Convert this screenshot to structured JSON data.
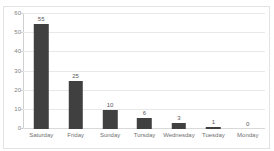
{
  "chart_data": {
    "type": "bar",
    "title": "",
    "xlabel": "",
    "ylabel": "",
    "categories": [
      "Saturday",
      "Friday",
      "Sunday",
      "Tursday",
      "Wednesday",
      "Tuesday",
      "Monday"
    ],
    "values": [
      55,
      25,
      10,
      6,
      3,
      1,
      0
    ],
    "value_labels": [
      "55",
      "25",
      "10",
      "6",
      "3",
      "1",
      "0"
    ],
    "ylim": [
      0,
      60
    ],
    "yticks": [
      0,
      10,
      20,
      30,
      40,
      50,
      60
    ],
    "ytick_labels": [
      "0",
      "10",
      "20",
      "30",
      "40",
      "50",
      "60"
    ],
    "grid": true,
    "grid_axis": "y",
    "legend": false,
    "legend_position": "none",
    "series": [
      {
        "name": "",
        "values": [
          55,
          25,
          10,
          6,
          3,
          1,
          0
        ]
      }
    ]
  },
  "style": {
    "bar_color": "#404040",
    "gridline_color": "#e8e8e8",
    "axis_color": "#d0d0d0",
    "frame_color": "#e3e3e3",
    "label_color": "#707070",
    "value_label_color": "#595959",
    "background": "#ffffff"
  }
}
